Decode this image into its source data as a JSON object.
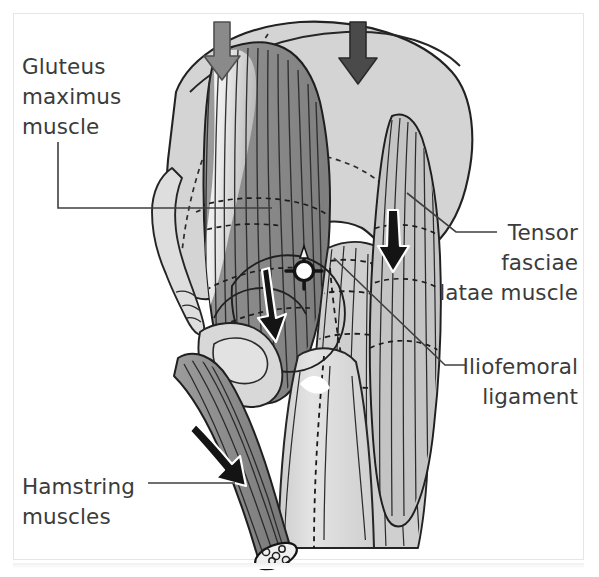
{
  "figure": {
    "kind": "anatomical-illustration",
    "background_color": "#ffffff",
    "frame_color": "#e6e6e6",
    "text_color": "#3b3b3b",
    "outline_color": "#1e1e1e"
  },
  "labels": {
    "gluteus": "Gluteus\nmaximus\nmuscle",
    "tensor": "Tensor\nfasciae\nlatae muscle",
    "iliofemoral": "Iliofemoral\nligament",
    "hamstring": "Hamstring\nmuscles"
  },
  "palette": {
    "bone_light": "#d2d2d2",
    "bone_pale": "#dcdcdc",
    "muscle_dark": "#8f8f8f",
    "muscle_mid": "#a9a9a9",
    "fascia_light": "#c9c9c9",
    "femur": "#d9d9d9",
    "highlight": "#ffffff",
    "arrow_gray": "#8a8a8a",
    "arrow_dark": "#4a4a4a",
    "arrow_black": "#151515",
    "leader": "#3f3f3f"
  },
  "arrows": [
    {
      "name": "load-arrow-left",
      "direction": "down",
      "color": "#8a8a8a",
      "x": 222,
      "y": 22
    },
    {
      "name": "load-arrow-right",
      "direction": "down",
      "color": "#4a4a4a",
      "x": 358,
      "y": 22
    },
    {
      "name": "gluteus-pull-arrow",
      "direction": "down-left",
      "color": "#151515",
      "x": 271,
      "y": 274
    },
    {
      "name": "tensor-pull-arrow",
      "direction": "down",
      "color": "#151515",
      "x": 393,
      "y": 215
    },
    {
      "name": "hamstring-pull-arrow",
      "direction": "down-right",
      "color": "#151515",
      "x": 205,
      "y": 428
    }
  ],
  "markers": {
    "hip-joint-center": {
      "name": "hip-joint-center",
      "x": 304,
      "y": 271,
      "radius": 9,
      "fill": "#ffffff",
      "ring": "#151515"
    }
  },
  "leader_lines": [
    {
      "name": "leader-gluteus",
      "points": "58,142 58,208 272,208"
    },
    {
      "name": "leader-tensor",
      "points": "407,193 456,232 497,232"
    },
    {
      "name": "leader-iliofemoral",
      "points": "334,258 445,365 466,365"
    },
    {
      "name": "leader-hamstring",
      "points": "148,483 235,483"
    }
  ]
}
